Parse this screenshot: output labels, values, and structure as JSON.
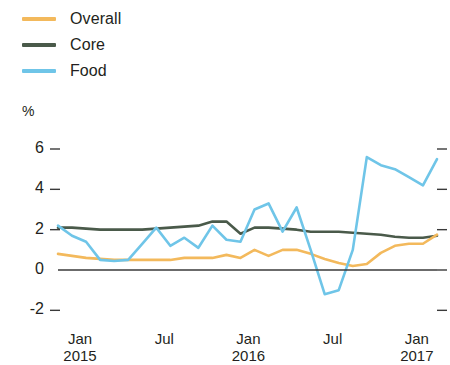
{
  "chart_data": {
    "type": "line",
    "title": "",
    "subtitle": "",
    "xlabel": "",
    "ylabel": "%",
    "ylim": [
      -2,
      6
    ],
    "yticks": [
      -2,
      0,
      2,
      4,
      6
    ],
    "ytick_labels": [
      "-2",
      "0",
      "2",
      "4",
      "6"
    ],
    "grid": false,
    "legend_position": "top-left",
    "x_tick_labels": [
      {
        "month": "Jan",
        "year": "2015"
      },
      {
        "month": "Jul",
        "year": ""
      },
      {
        "month": "Jan",
        "year": "2016"
      },
      {
        "month": "Jul",
        "year": ""
      },
      {
        "month": "Jan",
        "year": "2017"
      }
    ],
    "x": [
      "2015-01",
      "2015-02",
      "2015-03",
      "2015-04",
      "2015-05",
      "2015-06",
      "2015-07",
      "2015-08",
      "2015-09",
      "2015-10",
      "2015-11",
      "2015-12",
      "2016-01",
      "2016-02",
      "2016-03",
      "2016-04",
      "2016-05",
      "2016-06",
      "2016-07",
      "2016-08",
      "2016-09",
      "2016-10",
      "2016-11",
      "2016-12",
      "2017-01",
      "2017-02",
      "2017-03",
      "2017-04"
    ],
    "series": [
      {
        "name": "Overall",
        "color": "#f3b95c",
        "values": [
          0.8,
          0.7,
          0.6,
          0.55,
          0.5,
          0.5,
          0.5,
          0.5,
          0.5,
          0.6,
          0.6,
          0.6,
          0.75,
          0.6,
          1.0,
          0.7,
          1.0,
          1.0,
          0.8,
          0.55,
          0.35,
          0.2,
          0.3,
          0.85,
          1.2,
          1.3,
          1.3,
          1.75
        ]
      },
      {
        "name": "Core",
        "color": "#4a5a4a",
        "values": [
          2.1,
          2.1,
          2.05,
          2.0,
          2.0,
          2.0,
          2.0,
          2.05,
          2.1,
          2.15,
          2.2,
          2.4,
          2.4,
          1.8,
          2.1,
          2.1,
          2.05,
          2.0,
          1.9,
          1.9,
          1.9,
          1.85,
          1.8,
          1.75,
          1.65,
          1.6,
          1.6,
          1.7
        ]
      },
      {
        "name": "Food",
        "color": "#6fc5e8",
        "values": [
          2.2,
          1.7,
          1.4,
          0.5,
          0.45,
          0.5,
          1.3,
          2.1,
          1.2,
          1.6,
          1.1,
          2.2,
          1.5,
          1.4,
          3.0,
          3.3,
          1.9,
          3.1,
          1.0,
          -1.2,
          -1.0,
          1.0,
          5.6,
          5.2,
          5.0,
          4.6,
          4.2,
          5.5
        ]
      }
    ]
  },
  "legend": {
    "items": [
      {
        "label": "Overall",
        "color": "#f3b95c"
      },
      {
        "label": "Core",
        "color": "#4a5a4a"
      },
      {
        "label": "Food",
        "color": "#6fc5e8"
      }
    ]
  },
  "axis": {
    "unit_label": "%"
  }
}
